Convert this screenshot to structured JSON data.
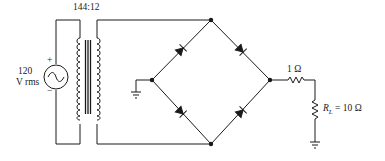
{
  "diagram": {
    "type": "bridge-rectifier-circuit",
    "source": {
      "label_line1": "120",
      "label_line2": "V rms",
      "plus": "+",
      "minus": "−",
      "icon": "ac-source-icon"
    },
    "transformer": {
      "ratio": "144:12",
      "icon": "transformer-icon"
    },
    "bridge": {
      "diodes": 4,
      "icon": "diode-icon"
    },
    "series_resistor": {
      "label": "1 Ω"
    },
    "load_resistor": {
      "symbol": "R",
      "subscript": "L",
      "value": " = 10 Ω"
    },
    "grounds": [
      "bridge-left-node-ground",
      "load-ground"
    ]
  }
}
